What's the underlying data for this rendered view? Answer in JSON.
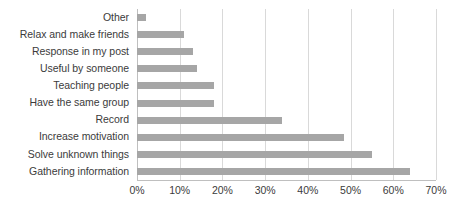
{
  "chart_data": {
    "type": "bar",
    "orientation": "horizontal",
    "title": "",
    "subtitle": "",
    "xlabel": "",
    "ylabel": "",
    "xlim": [
      0,
      70
    ],
    "x_tick_step": 10,
    "x_tick_labels": [
      "0%",
      "10%",
      "20%",
      "30%",
      "40%",
      "50%",
      "60%",
      "70%"
    ],
    "x_tick_values": [
      0,
      10,
      20,
      30,
      40,
      50,
      60,
      70
    ],
    "grid": "vertical",
    "legend": "none",
    "value_suffix": "%",
    "bar_color": "#a6a6a6",
    "gridline_color": "#d9d9d9",
    "text_color": "#3b3b3b",
    "categories": [
      "Other",
      "Relax and make friends",
      "Response in my post",
      "Useful by someone",
      "Teaching people",
      "Have the same group",
      "Record",
      "Increase motivation",
      "Solve unknown things",
      "Gathering information"
    ],
    "values": [
      2,
      11,
      13,
      14,
      18,
      18,
      34,
      48.5,
      55,
      64
    ]
  }
}
